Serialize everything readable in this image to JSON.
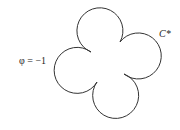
{
  "diagram": {
    "type": "four-lobed contour",
    "curve_label": "C*",
    "point_label": "φ = −1",
    "stroke_color": "#333333",
    "background": "#ffffff"
  }
}
